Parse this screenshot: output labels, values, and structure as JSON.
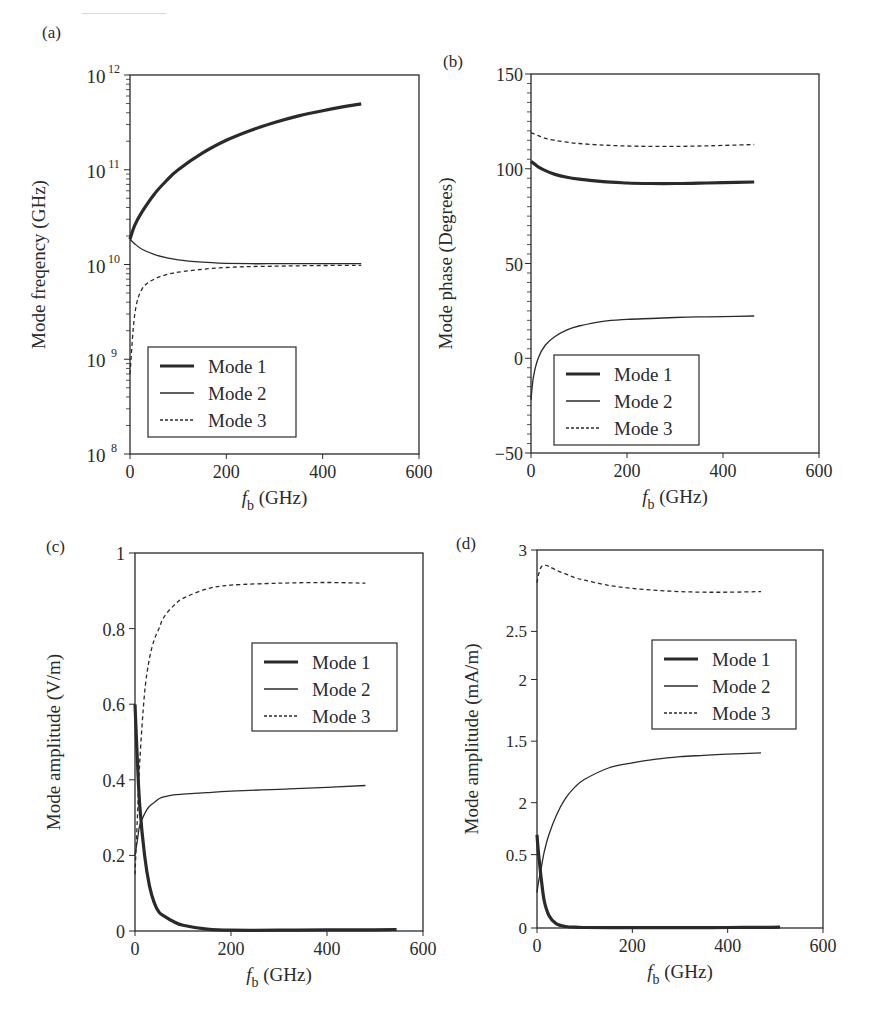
{
  "figure": {
    "legend_entries": [
      "Mode 1",
      "Mode 2",
      "Mode 3"
    ]
  },
  "chart_data": [
    {
      "panel": "(a)",
      "type": "line",
      "title": "",
      "xlabel": "f_b (GHz)",
      "ylabel": "Mode freqency (GHz)",
      "xlim": [
        0,
        600
      ],
      "ylim": [
        100000000.0,
        1000000000000.0
      ],
      "yscale": "log",
      "xticks": [
        0,
        200,
        400,
        600
      ],
      "yticks": [
        100000000.0,
        1000000000.0,
        10000000000.0,
        100000000000.0,
        1000000000000.0
      ],
      "ytick_labels": [
        "10^8",
        "10^9",
        "10^10",
        "10^11",
        "10^12"
      ],
      "grid": false,
      "legend_position": "lower left",
      "x": [
        0,
        10,
        25,
        50,
        75,
        100,
        150,
        200,
        250,
        300,
        350,
        400,
        450,
        480
      ],
      "series": [
        {
          "name": "Mode 1",
          "style": "thick-solid",
          "values": [
            18500000000.0,
            26000000000.0,
            36000000000.0,
            55000000000.0,
            76000000000.0,
            100000000000.0,
            150000000000.0,
            205000000000.0,
            260000000000.0,
            315000000000.0,
            370000000000.0,
            420000000000.0,
            470000000000.0,
            495000000000.0
          ]
        },
        {
          "name": "Mode 2",
          "style": "thin-solid",
          "values": [
            18500000000.0,
            16500000000.0,
            14500000000.0,
            12800000000.0,
            11800000000.0,
            11200000000.0,
            10600000000.0,
            10300000000.0,
            10200000000.0,
            10200000000.0,
            10200000000.0,
            10200000000.0,
            10200000000.0,
            10200000000.0
          ]
        },
        {
          "name": "Mode 3",
          "style": "dashed",
          "values": [
            700000000.0,
            3000000000.0,
            5500000000.0,
            7000000000.0,
            7800000000.0,
            8300000000.0,
            8900000000.0,
            9300000000.0,
            9500000000.0,
            9600000000.0,
            9700000000.0,
            9750000000.0,
            9800000000.0,
            9800000000.0
          ]
        }
      ]
    },
    {
      "panel": "(b)",
      "type": "line",
      "title": "",
      "xlabel": "f_b (GHz)",
      "ylabel": "Mode phase (Degrees)",
      "xlim": [
        0,
        600
      ],
      "ylim": [
        -50,
        150
      ],
      "xticks": [
        0,
        200,
        400,
        600
      ],
      "yticks": [
        -50,
        0,
        50,
        100,
        150
      ],
      "ytick_labels": [
        "−50",
        "0",
        "50",
        "100",
        "150"
      ],
      "grid": false,
      "legend_position": "lower left",
      "x": [
        0,
        5,
        15,
        30,
        50,
        75,
        100,
        150,
        200,
        250,
        300,
        350,
        400,
        465
      ],
      "series": [
        {
          "name": "Mode 1",
          "style": "thick-solid",
          "values": [
            104,
            103,
            101,
            99,
            97,
            95.5,
            94.5,
            93.2,
            92.5,
            92.2,
            92.2,
            92.4,
            92.7,
            93
          ]
        },
        {
          "name": "Mode 2",
          "style": "thin-solid",
          "values": [
            -22,
            -10,
            0,
            7,
            11.5,
            15,
            17,
            19.5,
            20.5,
            21,
            21.5,
            21.8,
            22,
            22.3
          ]
        },
        {
          "name": "Mode 3",
          "style": "dashed",
          "values": [
            119,
            118.5,
            117.5,
            116,
            115,
            114,
            113.3,
            112.5,
            112,
            111.8,
            111.8,
            112,
            112.3,
            112.8
          ]
        }
      ]
    },
    {
      "panel": "(c)",
      "type": "line",
      "title": "",
      "xlabel": "f_b (GHz)",
      "ylabel": "Mode amplitude (V/m)",
      "xlim": [
        0,
        600
      ],
      "ylim": [
        0,
        1
      ],
      "xticks": [
        0,
        200,
        400,
        600
      ],
      "yticks": [
        0,
        0.2,
        0.4,
        0.6,
        0.8,
        1
      ],
      "ytick_labels": [
        "0",
        "0.2",
        "0.4",
        "0.6",
        "0.8",
        "1"
      ],
      "grid": false,
      "legend_position": "center right",
      "x": [
        0,
        5,
        10,
        20,
        30,
        40,
        50,
        60,
        80,
        100,
        150,
        200,
        300,
        400,
        480,
        545
      ],
      "series": [
        {
          "name": "Mode 1",
          "style": "thick-solid",
          "values": [
            0.6,
            0.45,
            0.33,
            0.2,
            0.12,
            0.075,
            0.05,
            0.04,
            0.025,
            0.015,
            0.005,
            0.002,
            0.002,
            0.003,
            0.003,
            0.004
          ]
        },
        {
          "name": "Mode 2",
          "style": "thin-solid",
          "values": [
            0.2,
            0.24,
            0.28,
            0.31,
            0.33,
            0.34,
            0.35,
            0.355,
            0.36,
            0.362,
            0.366,
            0.37,
            0.375,
            0.38,
            0.385,
            null
          ]
        },
        {
          "name": "Mode 3",
          "style": "dashed",
          "values": [
            0.15,
            0.3,
            0.45,
            0.63,
            0.72,
            0.77,
            0.8,
            0.83,
            0.86,
            0.88,
            0.905,
            0.915,
            0.92,
            0.922,
            0.92,
            null
          ]
        }
      ]
    },
    {
      "panel": "(d)",
      "type": "line",
      "title": "",
      "xlabel": "f_b (GHz)",
      "ylabel": "Mode amplitude (mA/m)",
      "xlim": [
        0,
        600
      ],
      "ylim": [
        0,
        3
      ],
      "xticks": [
        0,
        200,
        400,
        600
      ],
      "yticks_pixel_fraction": [
        0,
        0.1941,
        0.3315,
        0.4943,
        0.6574,
        0.7846,
        1.0
      ],
      "ytick_labels": [
        "0",
        "0.5",
        "2",
        "1.5",
        "2",
        "2.5",
        "3"
      ],
      "grid": false,
      "legend_position": "upper right",
      "x": [
        0,
        3,
        8,
        15,
        25,
        40,
        60,
        80,
        100,
        150,
        200,
        250,
        300,
        350,
        400,
        470,
        510
      ],
      "series": [
        {
          "name": "Mode 1",
          "style": "thick-solid",
          "values": [
            0.74,
            0.6,
            0.42,
            0.22,
            0.1,
            0.035,
            0.012,
            0.006,
            0.004,
            0.003,
            0.003,
            0.003,
            0.003,
            0.003,
            0.004,
            0.005,
            0.006
          ]
        },
        {
          "name": "Mode 2",
          "style": "thin-solid",
          "values": [
            0.28,
            0.36,
            0.46,
            0.6,
            0.74,
            0.89,
            1.03,
            1.12,
            1.18,
            1.27,
            1.31,
            1.34,
            1.36,
            1.37,
            1.38,
            1.39,
            null
          ]
        },
        {
          "name": "Mode 3",
          "style": "dashed",
          "values": [
            2.74,
            2.8,
            2.86,
            2.88,
            2.87,
            2.84,
            2.81,
            2.78,
            2.76,
            2.72,
            2.695,
            2.68,
            2.67,
            2.665,
            2.665,
            2.67,
            null
          ]
        }
      ]
    }
  ],
  "panels": [
    {
      "label": "(a)",
      "xlabel_main": "f",
      "xlabel_sub": "b",
      "xlabel_unit": " (GHz)",
      "ylabel": "Mode freqency (GHz)"
    },
    {
      "label": "(b)",
      "xlabel_main": "f",
      "xlabel_sub": "b",
      "xlabel_unit": " (GHz)",
      "ylabel": "Mode phase (Degrees)"
    },
    {
      "label": "(c)",
      "xlabel_main": "f",
      "xlabel_sub": "b",
      "xlabel_unit": " (GHz)",
      "ylabel": "Mode amplitude (V/m)"
    },
    {
      "label": "(d)",
      "xlabel_main": "f",
      "xlabel_sub": "b",
      "xlabel_unit": " (GHz)",
      "ylabel": "Mode amplitude (mA/m)"
    }
  ],
  "colors": {
    "ink": "#2a2a2a",
    "background": "#ffffff"
  }
}
